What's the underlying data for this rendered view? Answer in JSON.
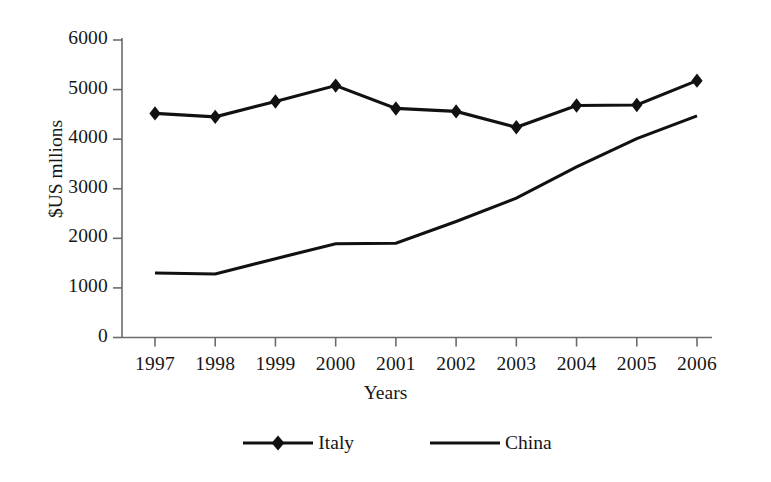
{
  "chart_data": {
    "type": "line",
    "title": "",
    "xlabel": "Years",
    "ylabel": "$US mllions",
    "categories": [
      "1997",
      "1998",
      "1999",
      "2000",
      "2001",
      "2002",
      "2003",
      "2004",
      "2005",
      "2006"
    ],
    "x": [
      1997,
      1998,
      1999,
      2000,
      2001,
      2002,
      2003,
      2004,
      2005,
      2006
    ],
    "xlim": [
      1997,
      2006
    ],
    "ylim": [
      0,
      6000
    ],
    "yticks": [
      "0",
      "1000",
      "2000",
      "3000",
      "4000",
      "5000",
      "6000"
    ],
    "ytick_values": [
      0,
      1000,
      2000,
      3000,
      4000,
      5000,
      6000
    ],
    "grid": false,
    "legend_position": "bottom",
    "series": [
      {
        "name": "Italy",
        "marker": "diamond",
        "color": "#000000",
        "values": [
          4520,
          4450,
          4760,
          5080,
          4620,
          4560,
          4240,
          4680,
          4690,
          5180
        ]
      },
      {
        "name": "China",
        "marker": "none",
        "color": "#000000",
        "values": [
          1300,
          1280,
          1590,
          1890,
          1900,
          2340,
          2810,
          3440,
          4010,
          4470
        ]
      }
    ]
  },
  "axis": {
    "x_title": "Years",
    "y_title": "$US mllions",
    "x_tick_labels": [
      "1997",
      "1998",
      "1999",
      "2000",
      "2001",
      "2002",
      "2003",
      "2004",
      "2005",
      "2006"
    ],
    "y_tick_labels": [
      "6000",
      "5000",
      "4000",
      "3000",
      "2000",
      "1000",
      "0"
    ]
  },
  "legend": {
    "items": [
      {
        "label": "Italy",
        "marker": "diamond"
      },
      {
        "label": "China",
        "marker": "none"
      }
    ]
  },
  "colors": {
    "ink": "#000000",
    "axis": "#555555",
    "background": "#ffffff"
  }
}
